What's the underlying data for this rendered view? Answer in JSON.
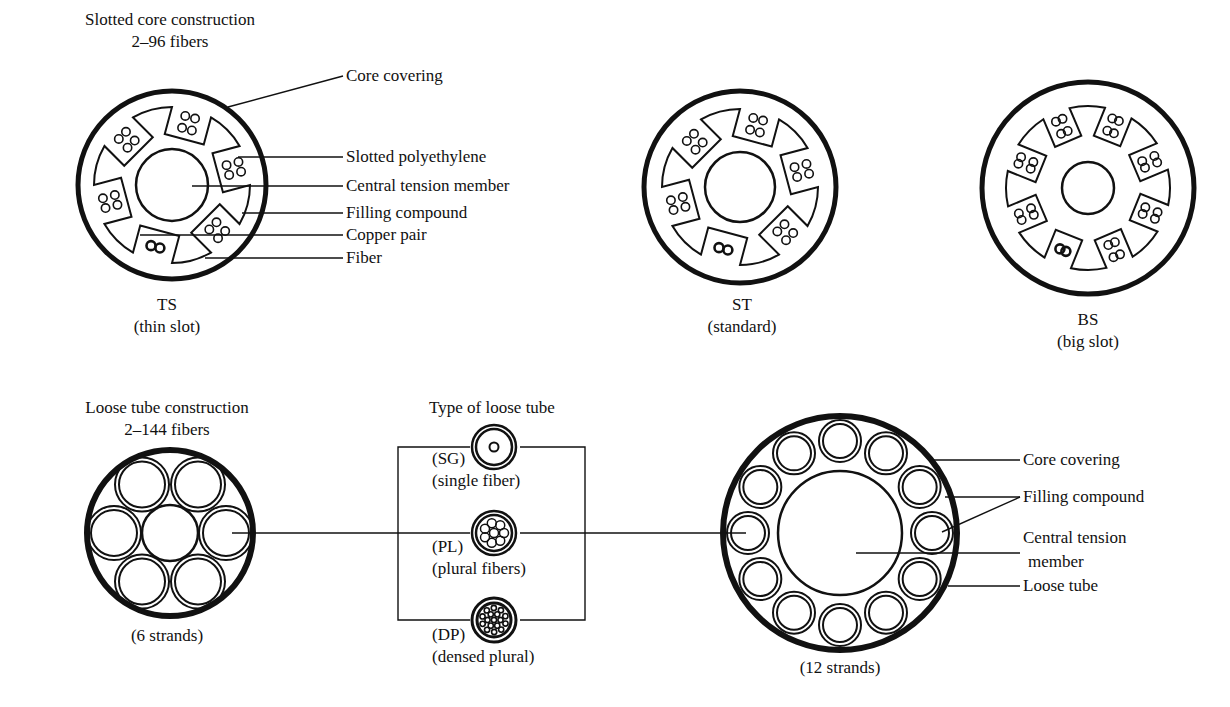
{
  "slotted": {
    "title": "Slotted core construction",
    "subtitle": "2–96 fibers",
    "callouts": [
      "Core covering",
      "Slotted polyethylene",
      "Central tension member",
      "Filling compound",
      "Copper pair",
      "Fiber"
    ],
    "variants": [
      {
        "code": "TS",
        "name": "(thin slot)"
      },
      {
        "code": "ST",
        "name": "(standard)"
      },
      {
        "code": "BS",
        "name": "(big slot)"
      }
    ]
  },
  "loose": {
    "title": "Loose tube construction",
    "subtitle": "2–144 fibers",
    "six_caption": "(6 strands)",
    "types_title": "Type of loose tube",
    "types": [
      {
        "code": "(SG)",
        "name": "(single fiber)"
      },
      {
        "code": "(PL)",
        "name": "(plural fibers)"
      },
      {
        "code": "(DP)",
        "name": "(densed plural)"
      }
    ],
    "twelve_caption": "(12 strands)",
    "callouts": [
      "Core covering",
      "Filling compound",
      "Central tension",
      "member",
      "Loose tube"
    ]
  },
  "colors": {
    "ink": "#111111",
    "background": "#ffffff"
  }
}
